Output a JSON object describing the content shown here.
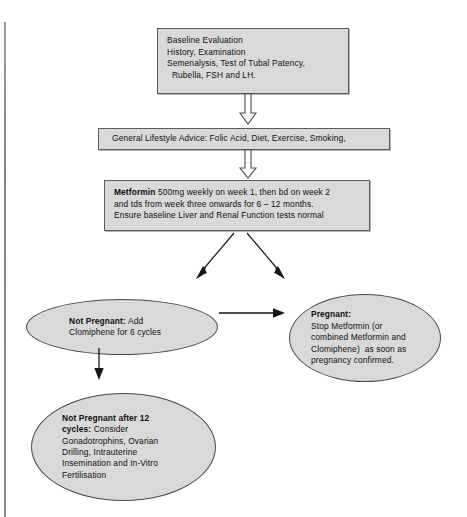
{
  "diagram": {
    "colors": {
      "node_fill": "#d9d9d9",
      "node_border": "#5c5c5c",
      "ellipse_border": "#4a4a4a",
      "connector": "#161616",
      "background": "#ffffff"
    }
  },
  "nodes": {
    "baseline": {
      "name": "Baseline Evaluation",
      "lines": [
        "Baseline Evaluation",
        "History, Examination",
        "Semenalysis, Test of Tubal Patency,",
        "  Rubella, FSH and LH."
      ]
    },
    "lifestyle": {
      "name": "General Lifestyle Advice",
      "lines": [
        "General Lifestyle Advice: Folic Acid, Diet, Exercise, Smoking,"
      ]
    },
    "metformin": {
      "name": "Metformin",
      "bold_lead": "Metformin",
      "lines": [
        " 500mg weekly on week 1, then bd on week 2",
        "and tds from week three onwards for 6 – 12 months.",
        "Ensure baseline Liver and Renal Function tests normal"
      ]
    },
    "not_pregnant": {
      "name": "Not Pregnant",
      "bold_lead": "Not Pregnant:",
      "lines": [
        " Add",
        "Clomiphene for 6 cycles"
      ]
    },
    "pregnant": {
      "name": "Pregnant",
      "bold_lead": "Pregnant:",
      "lines": [
        "Stop Metformin (or",
        "combined Metformin and",
        "Clomiphene)  as soon as",
        "pregnancy confirmed."
      ]
    },
    "after_12_cycles": {
      "name": "Not Pregnant after 12 cycles",
      "bold_lead_line_1": "Not Pregnant after 12",
      "bold_lead_line_2": "cycles:",
      "lines": [
        " Consider",
        "Gonadotrophins, Ovarian",
        "Drilling, Intrauterine",
        "Insemination and In-Vitro",
        "Fertilisation"
      ]
    }
  },
  "connectors": {
    "block_arrow_1": "block-arrow-down",
    "block_arrow_2": "block-arrow-down",
    "diagonal_left": "arrow-down-left",
    "diagonal_right": "arrow-down-right",
    "horizontal": "arrow-right",
    "vertical": "arrow-down"
  }
}
